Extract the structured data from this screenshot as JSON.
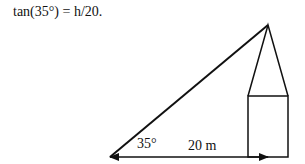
{
  "equation": "tan(35°) = h/20.",
  "diagram": {
    "angle_label": "35°",
    "base_label": "20 m",
    "stroke_color": "#111111"
  }
}
